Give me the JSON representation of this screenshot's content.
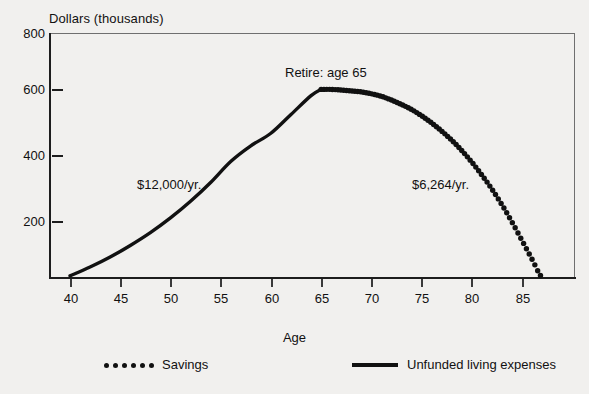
{
  "chart_data": {
    "type": "line",
    "title": "",
    "ylabel": "Dollars (thousands)",
    "xlabel": "Age",
    "xlim": [
      39,
      89
    ],
    "ylim": [
      0,
      800
    ],
    "grid": false,
    "legend_position": "bottom",
    "y_ticks": [
      800,
      600,
      400,
      200
    ],
    "y_tick_labels": [
      "800",
      "600",
      "400",
      "200"
    ],
    "x_ticks": [
      40,
      45,
      50,
      55,
      60,
      65,
      70,
      75,
      80,
      85
    ],
    "x_tick_labels": [
      "40",
      "45",
      "50",
      "55",
      "60",
      "65",
      "70",
      "75",
      "80",
      "85"
    ],
    "annotations": [
      {
        "text": "Retire: age 65",
        "x": 65,
        "y": 700
      },
      {
        "text": "$12,000/yr.",
        "x": 50,
        "y": 300
      },
      {
        "text": "$6,264/yr.",
        "x": 77,
        "y": 300
      }
    ],
    "series": [
      {
        "name": "Unfunded living expenses",
        "style": "solid-line",
        "x": [
          40,
          42,
          44,
          46,
          48,
          50,
          52,
          54,
          56,
          58,
          60,
          62,
          64,
          65
        ],
        "values": [
          25,
          53,
          85,
          122,
          163,
          210,
          263,
          323,
          390,
          440,
          480,
          540,
          600,
          620
        ]
      },
      {
        "name": "Savings",
        "style": "dotted-line",
        "x": [
          65,
          66,
          67,
          68,
          69,
          70,
          71,
          72,
          73,
          74,
          75,
          76,
          77,
          78,
          79,
          80,
          81,
          82,
          83,
          84,
          85,
          86,
          87
        ],
        "values": [
          620,
          620,
          618,
          615,
          612,
          606,
          598,
          586,
          572,
          556,
          536,
          513,
          487,
          458,
          425,
          388,
          347,
          302,
          252,
          197,
          138,
          78,
          20
        ]
      }
    ]
  },
  "axes": {
    "y_title": "Dollars (thousands)",
    "x_title": "Age",
    "y_tick_labels": [
      "800",
      "600",
      "400",
      "200"
    ],
    "x_tick_labels": [
      "40",
      "45",
      "50",
      "55",
      "60",
      "65",
      "70",
      "75",
      "80",
      "85"
    ]
  },
  "annotations": {
    "retire": "Retire: age 65",
    "contribution": "$12,000/yr.",
    "withdrawal": "$6,264/yr."
  },
  "legend": {
    "savings_label": "Savings",
    "expenses_label": "Unfunded living expenses"
  },
  "colors": {
    "ink": "#111111",
    "frame": "#6f6f6f",
    "background": "#f1f0ee"
  }
}
